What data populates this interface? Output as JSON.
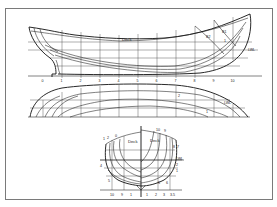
{
  "figure": {
    "type": "ship lines plan",
    "views": [
      "profile",
      "half-breadth plan",
      "body plan"
    ]
  },
  "profile": {
    "deck_label": "Deck",
    "waterline_label": "LWL",
    "station_labels": [
      "0",
      "1",
      "2",
      "3",
      "4",
      "5",
      "6",
      "7",
      "8",
      "9",
      "10"
    ],
    "buttock_labels": [
      "B1",
      "B2",
      "1"
    ]
  },
  "plan": {
    "waterline_label": "LWL",
    "line_labels": [
      "2",
      "1"
    ]
  },
  "body_plan": {
    "deck_label_left": "Deck",
    "deck_label_right": "Deck",
    "waterline_label": "LWL",
    "left_station_labels": [
      "1",
      "2",
      "0",
      "4",
      "5"
    ],
    "right_station_labels": [
      "10",
      "9",
      "8",
      "7",
      "2",
      "1",
      "5",
      "6"
    ],
    "bottom_scale_labels": [
      "10",
      "9",
      "1",
      "1",
      "2",
      "3",
      "3.5"
    ]
  },
  "colors": {
    "frame": "#7a7a7a",
    "lines": "#1a1a1a",
    "background": "#ffffff"
  }
}
